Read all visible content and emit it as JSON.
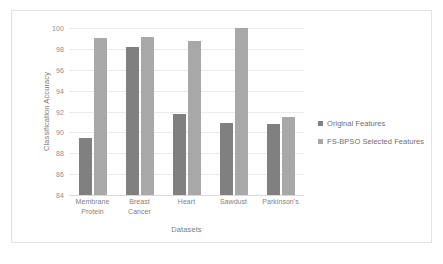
{
  "chart_data": {
    "type": "bar",
    "title": "",
    "xlabel": "Datasets",
    "ylabel": "Classification Accuracy",
    "ylim": [
      84,
      100
    ],
    "yticks": [
      84,
      86,
      88,
      90,
      92,
      94,
      96,
      98,
      100
    ],
    "grid": true,
    "legend_position": "right",
    "categories": [
      "Membrane Protein",
      "Breast Cancer",
      "Heart",
      "Sawdust",
      "Parkinson's"
    ],
    "category_lines": [
      [
        "Membrane",
        "Protein"
      ],
      [
        "Breast",
        "Cancer"
      ],
      [
        "Heart"
      ],
      [
        "Sawdust"
      ],
      [
        "Parkinson's"
      ]
    ],
    "series": [
      {
        "name": "Original Features",
        "color": "#808080",
        "values": [
          89.5,
          98.2,
          91.8,
          90.9,
          90.8
        ]
      },
      {
        "name": "FS-BPSO Selected Features",
        "color": "#a8a8a8",
        "values": [
          99.0,
          99.1,
          98.8,
          100.0,
          91.5
        ]
      }
    ]
  }
}
